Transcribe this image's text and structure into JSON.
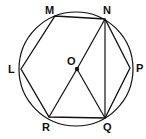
{
  "diagram": {
    "type": "geometry",
    "colors": {
      "stroke": "#111111",
      "background": "#ffffff"
    },
    "circle": {
      "center": "O",
      "cx": 76,
      "cy": 69,
      "r": 57
    },
    "points": {
      "M": {
        "x": 55,
        "y": 16,
        "label": "M",
        "lx": 45,
        "ly": 14
      },
      "N": {
        "x": 105,
        "y": 19,
        "label": "N",
        "lx": 103,
        "ly": 14
      },
      "P": {
        "x": 130,
        "y": 68,
        "label": "P",
        "lx": 136,
        "ly": 72
      },
      "Q": {
        "x": 105,
        "y": 118,
        "label": "Q",
        "lx": 103,
        "ly": 131
      },
      "R": {
        "x": 49,
        "y": 117,
        "label": "R",
        "lx": 42,
        "ly": 131
      },
      "L": {
        "x": 21,
        "y": 69,
        "label": "L",
        "lx": 8,
        "ly": 73
      },
      "O": {
        "x": 77,
        "y": 69,
        "label": "O",
        "lx": 67,
        "ly": 65
      }
    },
    "segments": [
      "LM",
      "MN",
      "NP",
      "PQ",
      "QR",
      "RL",
      "NO",
      "OR",
      "OQ",
      "NQ"
    ]
  }
}
